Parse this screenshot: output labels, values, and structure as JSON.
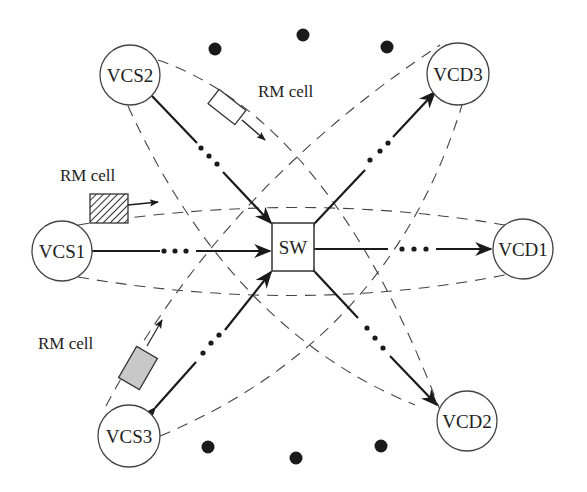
{
  "diagram": {
    "type": "network topology",
    "switch": {
      "label": "SW",
      "x": 272,
      "y": 223,
      "w": 42,
      "h": 48
    },
    "sources": [
      {
        "id": "vcs1",
        "label": "VCS1",
        "cx": 62,
        "cy": 251,
        "r": 30
      },
      {
        "id": "vcs2",
        "label": "VCS2",
        "cx": 130,
        "cy": 75,
        "r": 30
      },
      {
        "id": "vcs3",
        "label": "VCS3",
        "cx": 129,
        "cy": 436,
        "r": 31
      }
    ],
    "destinations": [
      {
        "id": "vcd1",
        "label": "VCD1",
        "cx": 523,
        "cy": 249,
        "r": 30
      },
      {
        "id": "vcd2",
        "label": "VCD2",
        "cx": 467,
        "cy": 421,
        "r": 30
      },
      {
        "id": "vcd3",
        "label": "VCD3",
        "cx": 458,
        "cy": 74,
        "r": 31
      }
    ],
    "rm_cells": [
      {
        "label": "RM cell",
        "style": "white",
        "near": "VCS2"
      },
      {
        "label": "RM cell",
        "style": "hatched",
        "near": "VCS1"
      },
      {
        "label": "RM cell",
        "style": "gray",
        "near": "VCS3"
      }
    ],
    "ellipsis_dots_top": [
      [
        215,
        49
      ],
      [
        303,
        35
      ],
      [
        387,
        47
      ]
    ],
    "ellipsis_dots_bottom": [
      [
        208,
        447
      ],
      [
        296,
        458
      ],
      [
        381,
        446
      ]
    ],
    "colors": {
      "line": "#1a1a1a",
      "dash": "#444444",
      "gray_cell": "#c8c8c8",
      "background": "#ffffff"
    }
  }
}
